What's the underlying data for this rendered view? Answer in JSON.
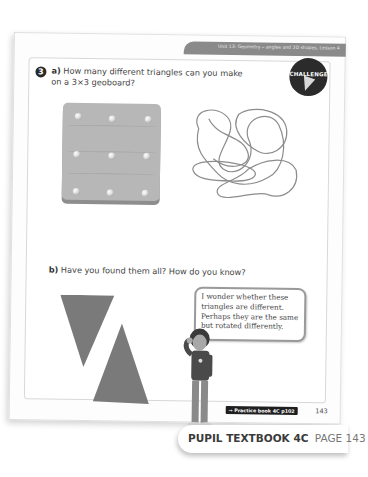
{
  "header": {
    "unit_label": "Unit 13: Geometry – angles and 2D shapes, Lesson 4"
  },
  "question": {
    "number": "3",
    "part_a_label": "a)",
    "part_a_text": "How many different triangles can you make on a 3×3 geoboard?",
    "part_b_label": "b)",
    "part_b_text": "Have you found them all? How do you know?"
  },
  "badge": {
    "label": "CHALLENGE",
    "icon": "lightning-bolt-icon"
  },
  "illustrations": {
    "geoboard": {
      "rows": 3,
      "cols": 3,
      "pegs": 9,
      "color": "#b7b7b7"
    },
    "rubber_bands": "tangled-rubber-bands",
    "triangles": [
      {
        "orientation": "pointing-down",
        "color": "#7a7a7a"
      },
      {
        "orientation": "pointing-up",
        "color": "#7a7a7a"
      }
    ],
    "character": "child-thinking"
  },
  "speech_bubble": {
    "text": "I wonder whether these triangles are different. Perhaps they are the same but rotated differently."
  },
  "footer": {
    "practice_link": "→ Practice book 4C p102",
    "page_number": "143",
    "book_label": "PUPIL TEXTBOOK 4C",
    "page_label": "PAGE 143"
  },
  "colors": {
    "header_band": "#8a8a8a",
    "badge_bg": "#2b2b2b",
    "text": "#444444"
  }
}
